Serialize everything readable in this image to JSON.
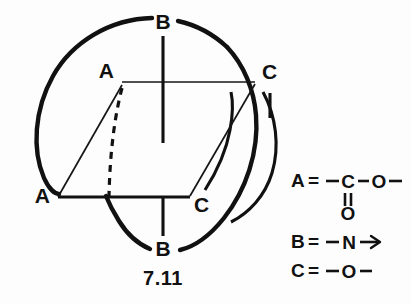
{
  "figure": {
    "caption": "7.11",
    "vertex_labels": {
      "top_back": "A",
      "left_front": "A",
      "top_right": "C",
      "bottom_right": "C",
      "top_stem": "B",
      "bottom_stem": "B"
    }
  },
  "legend": {
    "rows": [
      {
        "key": "A",
        "equals": "=",
        "formula": "–C(=O)–O–",
        "atoms": {
          "center": "C",
          "right": "O",
          "double_bonded": "O"
        }
      },
      {
        "key": "B",
        "equals": "=",
        "formula": "–N→",
        "atoms": {
          "center": "N"
        }
      },
      {
        "key": "C",
        "equals": "=",
        "formula": "–O–",
        "atoms": {
          "center": "O"
        }
      }
    ]
  },
  "colors": {
    "ink": "#111111",
    "background": "#fdfdfd"
  }
}
